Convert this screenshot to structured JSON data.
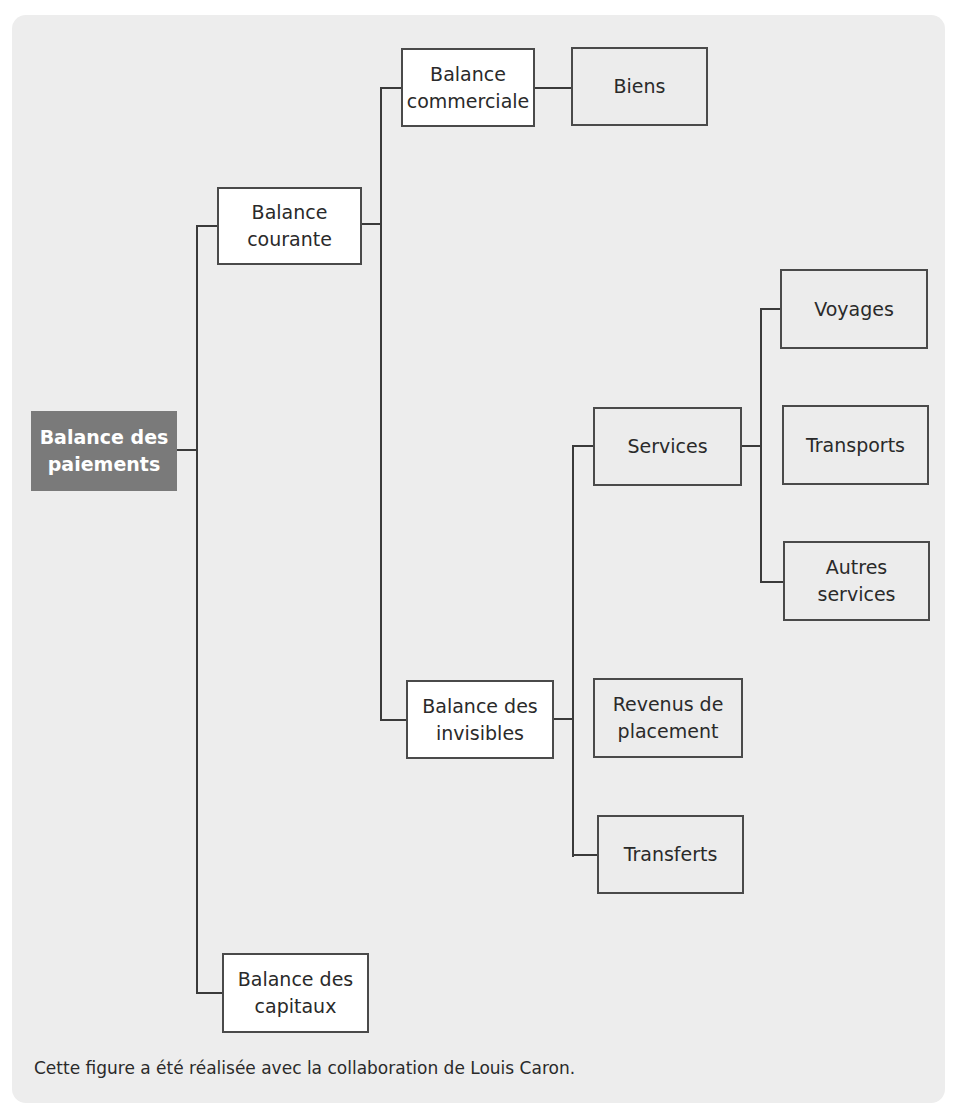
{
  "diagram": {
    "root": {
      "label": "Balance des\npaiements"
    },
    "nodes": {
      "balance_courante": {
        "label": "Balance\ncourante"
      },
      "balance_capitaux": {
        "label": "Balance des\ncapitaux"
      },
      "balance_commerciale": {
        "label": "Balance\ncommerciale"
      },
      "balance_invisibles": {
        "label": "Balance des\ninvisibles"
      },
      "biens": {
        "label": "Biens"
      },
      "services": {
        "label": "Services"
      },
      "revenus_placement": {
        "label": "Revenus de\nplacement"
      },
      "transferts": {
        "label": "Transferts"
      },
      "voyages": {
        "label": "Voyages"
      },
      "transports": {
        "label": "Transports"
      },
      "autres_services": {
        "label": "Autres\nservices"
      }
    },
    "edges": [
      [
        "Balance des paiements",
        "Balance courante"
      ],
      [
        "Balance des paiements",
        "Balance des capitaux"
      ],
      [
        "Balance courante",
        "Balance commerciale"
      ],
      [
        "Balance courante",
        "Balance des invisibles"
      ],
      [
        "Balance commerciale",
        "Biens"
      ],
      [
        "Balance des invisibles",
        "Services"
      ],
      [
        "Balance des invisibles",
        "Revenus de placement"
      ],
      [
        "Balance des invisibles",
        "Transferts"
      ],
      [
        "Services",
        "Voyages"
      ],
      [
        "Services",
        "Transports"
      ],
      [
        "Services",
        "Autres services"
      ]
    ]
  },
  "caption": "Cette figure a été réalisée avec la collaboration de Louis Caron.",
  "colors": {
    "panel_bg": "#ededed",
    "root_fill": "#7a7a7a",
    "border": "#4a4a4a"
  }
}
